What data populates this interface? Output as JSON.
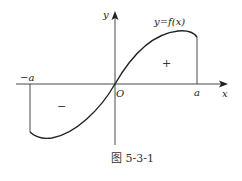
{
  "diagram": {
    "labels": {
      "y_axis": "y",
      "x_axis": "x",
      "origin": "O",
      "neg_a": "−a",
      "pos_a": "a",
      "function": "y=f(x)",
      "plus": "+",
      "minus": "−"
    },
    "caption": "图 5-3-1",
    "colors": {
      "stroke": "#222222",
      "background": "#ffffff"
    }
  }
}
